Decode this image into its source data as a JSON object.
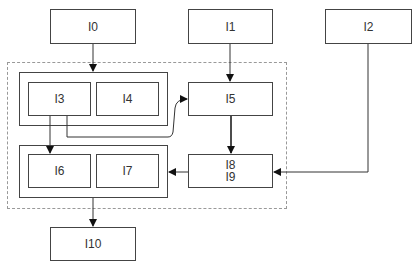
{
  "diagram": {
    "nodes": {
      "I0": {
        "label": "I0"
      },
      "I1": {
        "label": "I1"
      },
      "I2": {
        "label": "I2"
      },
      "I3": {
        "label": "I3"
      },
      "I4": {
        "label": "I4"
      },
      "I5": {
        "label": "I5"
      },
      "I6": {
        "label": "I6"
      },
      "I7": {
        "label": "I7"
      },
      "I8_I9": {
        "label_line1": "I8",
        "label_line2": "I9"
      },
      "I10": {
        "label": "I10"
      }
    },
    "groups": [
      {
        "id": "group-top",
        "members": [
          "I3",
          "I4"
        ]
      },
      {
        "id": "group-bottom",
        "members": [
          "I6",
          "I7"
        ]
      }
    ],
    "container": {
      "style": "dashed",
      "members": [
        "group-top",
        "group-bottom",
        "I5",
        "I8_I9"
      ]
    },
    "edges": [
      {
        "from": "I0",
        "to": "group-top"
      },
      {
        "from": "I1",
        "to": "I5"
      },
      {
        "from": "I3",
        "to": "I6"
      },
      {
        "from": "I3",
        "to": "I5",
        "style": "curved"
      },
      {
        "from": "I5",
        "to": "I8_I9"
      },
      {
        "from": "I2",
        "to": "I8_I9"
      },
      {
        "from": "I8_I9",
        "to": "group-bottom"
      },
      {
        "from": "group-bottom",
        "to": "I10"
      }
    ]
  }
}
